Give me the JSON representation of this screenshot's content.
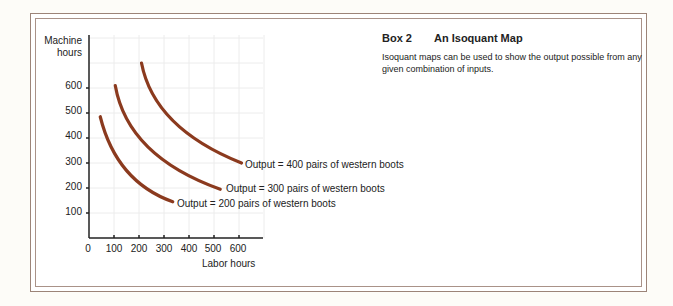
{
  "box": {
    "number": "Box 2",
    "title": "An Isoquant Map",
    "body": "Isoquant maps can be used to show the output possible from any given combination of inputs."
  },
  "chart_data": {
    "type": "line",
    "title": "An Isoquant Map",
    "xlabel": "Labor hours",
    "ylabel_lines": [
      "Machine",
      "hours"
    ],
    "x_ticks": [
      "0",
      "100",
      "200",
      "300",
      "400",
      "500",
      "600"
    ],
    "y_ticks": [
      "100",
      "200",
      "300",
      "400",
      "500",
      "600"
    ],
    "xlim": [
      0,
      700
    ],
    "ylim": [
      0,
      800
    ],
    "grid": true,
    "curve_color": "#8b3a1e",
    "series": [
      {
        "name": "Output = 200 pairs of western boots",
        "points": [
          [
            45,
            485
          ],
          [
            150,
            270
          ],
          [
            335,
            145
          ]
        ],
        "label_pos": [
          177,
          198
        ]
      },
      {
        "name": "Output = 300 pairs of western boots",
        "points": [
          [
            105,
            610
          ],
          [
            235,
            365
          ],
          [
            525,
            195
          ]
        ],
        "label_pos": [
          226,
          183
        ]
      },
      {
        "name": "Output = 400 pairs of western boots",
        "points": [
          [
            210,
            700
          ],
          [
            335,
            470
          ],
          [
            610,
            300
          ]
        ],
        "label_pos": [
          245,
          159
        ]
      }
    ]
  }
}
